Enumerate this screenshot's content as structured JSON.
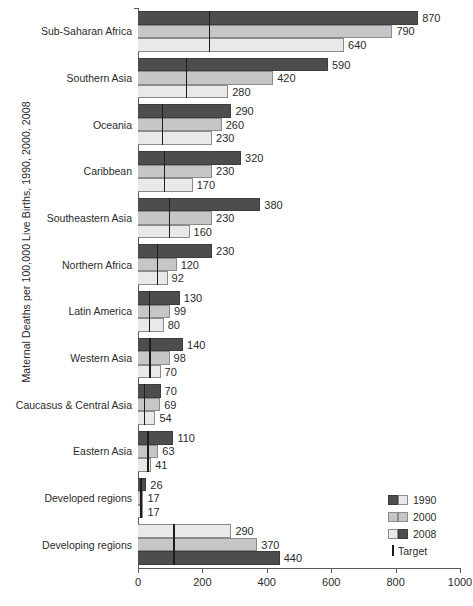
{
  "chart_data": {
    "type": "bar",
    "orientation": "horizontal",
    "title": "",
    "xlabel": "",
    "ylabel": "Maternal Deaths per 100,000 Live Births, 1990, 2000, 2008",
    "xlim": [
      0,
      1000
    ],
    "xticks": [
      0,
      200,
      400,
      600,
      800,
      1000
    ],
    "xtick_labels": [
      "0",
      "200",
      "400",
      "600",
      "800",
      "1000"
    ],
    "grid": false,
    "legend_position": "bottom-right",
    "series_names": [
      "1990",
      "2000",
      "2008"
    ],
    "categories": [
      "Sub-Saharan Africa",
      "Southern Asia",
      "Oceania",
      "Caribbean",
      "Southeastern Asia",
      "Northern Africa",
      "Latin America",
      "Western Asia",
      "Caucasus & Central Asia",
      "Eastern Asia",
      "Developed regions",
      "Developing regions"
    ],
    "series": [
      {
        "name": "1990",
        "values": [
          870,
          590,
          290,
          320,
          380,
          230,
          130,
          140,
          70,
          110,
          26,
          440
        ]
      },
      {
        "name": "2000",
        "values": [
          790,
          420,
          260,
          230,
          230,
          120,
          99,
          98,
          69,
          63,
          17,
          370
        ]
      },
      {
        "name": "2008",
        "values": [
          640,
          280,
          230,
          170,
          160,
          92,
          80,
          70,
          54,
          41,
          17,
          290
        ]
      }
    ],
    "targets": [
      220,
      148,
      73,
      80,
      95,
      58,
      33,
      35,
      18,
      28,
      7,
      110
    ],
    "target_label": "Target"
  },
  "legend": {
    "entries": [
      {
        "label": "1990"
      },
      {
        "label": "2000"
      },
      {
        "label": "2008"
      }
    ],
    "target_label": "Target"
  }
}
